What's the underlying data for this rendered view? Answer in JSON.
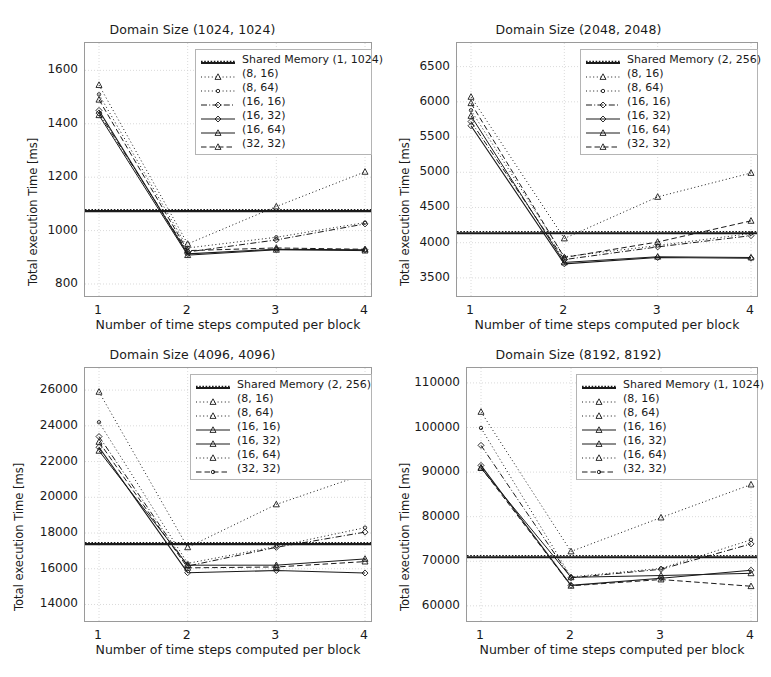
{
  "figure": {
    "width": 771,
    "height": 677,
    "background": "#ffffff",
    "line_color": "#1a1a1a",
    "grid_color": "#d0d0d0"
  },
  "common": {
    "xlabel": "Number of time steps computed per block",
    "ylabel": "Total execution Time [ms]",
    "xticks": [
      "1",
      "2",
      "3",
      "4"
    ],
    "xlim": [
      1,
      4
    ]
  },
  "chart_data": [
    {
      "type": "line",
      "title": "Domain Size (1024, 1024)",
      "xlabel": "Number of time steps computed per block",
      "ylabel": "Total execution Time [ms]",
      "x": [
        1,
        2,
        3,
        4
      ],
      "xlim": [
        1,
        4
      ],
      "ylim": [
        770,
        1680
      ],
      "yticks": [
        800,
        1000,
        1200,
        1400,
        1600
      ],
      "ytick_labels": [
        "800",
        "1000",
        "1200",
        "1400",
        "1600"
      ],
      "grid": true,
      "legend_position": "upper right",
      "hline": {
        "label": "Shared Memory (1, 1024)",
        "value": 1073
      },
      "series": [
        {
          "name": "(8, 16)",
          "values": [
            1545,
            950,
            1090,
            1220
          ]
        },
        {
          "name": "(8, 64)",
          "values": [
            1510,
            935,
            975,
            1030
          ]
        },
        {
          "name": "(16, 16)",
          "values": [
            1440,
            920,
            965,
            1025
          ]
        },
        {
          "name": "(16, 32)",
          "values": [
            1450,
            913,
            930,
            928
          ]
        },
        {
          "name": "(16, 64)",
          "values": [
            1432,
            908,
            928,
            925
          ]
        },
        {
          "name": "(32, 32)",
          "values": [
            1490,
            925,
            935,
            930
          ]
        }
      ]
    },
    {
      "type": "line",
      "title": "Domain Size (2048, 2048)",
      "xlabel": "Number of time steps computed per block",
      "ylabel": "Total execution Time [ms]",
      "x": [
        1,
        2,
        3,
        4
      ],
      "xlim": [
        1,
        4
      ],
      "ylim": [
        3300,
        6750
      ],
      "yticks": [
        3500,
        4000,
        4500,
        5000,
        5500,
        6000,
        6500
      ],
      "ytick_labels": [
        "3500",
        "4000",
        "4500",
        "5000",
        "5500",
        "6000",
        "6500"
      ],
      "grid": true,
      "legend_position": "upper right",
      "hline": {
        "label": "Shared Memory (2, 256)",
        "value": 4135
      },
      "series": [
        {
          "name": "(8, 16)",
          "values": [
            6070,
            4060,
            4650,
            4990
          ]
        },
        {
          "name": "(8, 64)",
          "values": [
            5880,
            3800,
            3960,
            4130
          ]
        },
        {
          "name": "(16, 16)",
          "values": [
            5720,
            3760,
            3940,
            4100
          ]
        },
        {
          "name": "(16, 32)",
          "values": [
            5660,
            3700,
            3790,
            3780
          ]
        },
        {
          "name": "(16, 64)",
          "values": [
            5800,
            3720,
            3800,
            3790
          ]
        },
        {
          "name": "(32, 32)",
          "values": [
            5980,
            3790,
            4010,
            4310
          ]
        }
      ]
    },
    {
      "type": "line",
      "title": "Domain Size (4096, 4096)",
      "xlabel": "Number of time steps computed per block",
      "ylabel": "Total execution Time [ms]",
      "x": [
        1,
        2,
        3,
        4
      ],
      "xlim": [
        1,
        4
      ],
      "ylim": [
        13300,
        26900
      ],
      "yticks": [
        14000,
        16000,
        18000,
        20000,
        22000,
        24000,
        26000
      ],
      "ytick_labels": [
        "14000",
        "16000",
        "18000",
        "20000",
        "22000",
        "24000",
        "26000"
      ],
      "grid": true,
      "legend_position": "upper right",
      "hline": {
        "label": "Shared Memory (2, 256)",
        "value": 17380
      },
      "series": [
        {
          "name": "(8, 16)",
          "values": [
            25900,
            17200,
            19600,
            21300
          ]
        },
        {
          "name": "(8, 64)",
          "values": [
            24200,
            16300,
            17250,
            18300
          ]
        },
        {
          "name": "(16, 16)",
          "values": [
            23400,
            16150,
            17200,
            18050
          ]
        },
        {
          "name": "(16, 32)",
          "values": [
            22800,
            15780,
            15900,
            15760
          ]
        },
        {
          "name": "(16, 64)",
          "values": [
            22600,
            16200,
            16200,
            16550
          ]
        },
        {
          "name": "(32, 32)",
          "values": [
            23100,
            16050,
            16100,
            16400
          ]
        }
      ]
    },
    {
      "type": "line",
      "title": "Domain Size (8192, 8192)",
      "xlabel": "Number of time steps computed per block",
      "ylabel": "Total execution Time [ms]",
      "x": [
        1,
        2,
        3,
        4
      ],
      "xlim": [
        1,
        4
      ],
      "ylim": [
        57500,
        112000
      ],
      "yticks": [
        60000,
        70000,
        80000,
        90000,
        100000,
        110000
      ],
      "ytick_labels": [
        "60000",
        "70000",
        "80000",
        "90000",
        "100000",
        "110000"
      ],
      "grid": true,
      "legend_position": "upper right",
      "hline": {
        "label": "Shared Memory (1, 1024)",
        "value": 70900
      },
      "series": [
        {
          "name": "(8, 16)",
          "values": [
            103500,
            72200,
            79800,
            87200
          ]
        },
        {
          "name": "(8, 64)",
          "values": [
            99900,
            66500,
            68400,
            74800
          ]
        },
        {
          "name": "(16, 16)",
          "values": [
            96000,
            66300,
            68200,
            73900
          ]
        },
        {
          "name": "(16, 32)",
          "values": [
            91500,
            64600,
            66200,
            68000
          ]
        },
        {
          "name": "(16, 64)",
          "values": [
            90900,
            66400,
            66800,
            67300
          ]
        },
        {
          "name": "(32, 32)",
          "values": [
            91000,
            64500,
            65900,
            64400
          ]
        }
      ]
    }
  ],
  "legends": [
    {
      "entries": [
        {
          "label": "Shared Memory (1, 1024)",
          "style": "solid-thick",
          "marker": "none"
        },
        {
          "label": "(8, 16)",
          "style": "dotted",
          "marker": "tri"
        },
        {
          "label": "(8, 64)",
          "style": "dotted",
          "marker": "dot"
        },
        {
          "label": "(16, 16)",
          "style": "dashdot",
          "marker": "diamond"
        },
        {
          "label": "(16, 32)",
          "style": "solid",
          "marker": "diamond"
        },
        {
          "label": "(16, 64)",
          "style": "solid",
          "marker": "tri"
        },
        {
          "label": "(32, 32)",
          "style": "dashed",
          "marker": "tri"
        }
      ]
    },
    {
      "entries": [
        {
          "label": "Shared Memory (2, 256)",
          "style": "solid-thick",
          "marker": "none"
        },
        {
          "label": "(8, 16)",
          "style": "dotted",
          "marker": "tri"
        },
        {
          "label": "(8, 64)",
          "style": "dotted",
          "marker": "dot"
        },
        {
          "label": "(16, 16)",
          "style": "dashdot",
          "marker": "diamond"
        },
        {
          "label": "(16, 32)",
          "style": "solid",
          "marker": "diamond"
        },
        {
          "label": "(16, 64)",
          "style": "solid",
          "marker": "tri"
        },
        {
          "label": "(32, 32)",
          "style": "dashed",
          "marker": "tri"
        }
      ]
    },
    {
      "entries": [
        {
          "label": "Shared Memory (2, 256)",
          "style": "solid-thick",
          "marker": "none"
        },
        {
          "label": "(8, 16)",
          "style": "dotted",
          "marker": "tri"
        },
        {
          "label": "(8, 64)",
          "style": "dotted",
          "marker": "tri"
        },
        {
          "label": "(16, 16)",
          "style": "solid",
          "marker": "tri"
        },
        {
          "label": "(16, 32)",
          "style": "solid",
          "marker": "tri"
        },
        {
          "label": "(16, 64)",
          "style": "dotted",
          "marker": "tri"
        },
        {
          "label": "(32, 32)",
          "style": "dashed",
          "marker": "dot"
        }
      ]
    },
    {
      "entries": [
        {
          "label": "Shared Memory (1, 1024)",
          "style": "solid-thick",
          "marker": "none"
        },
        {
          "label": "(8, 16)",
          "style": "dotted",
          "marker": "tri"
        },
        {
          "label": "(8, 64)",
          "style": "dotted",
          "marker": "tri"
        },
        {
          "label": "(16, 16)",
          "style": "solid",
          "marker": "tri"
        },
        {
          "label": "(16, 32)",
          "style": "solid",
          "marker": "tri"
        },
        {
          "label": "(16, 64)",
          "style": "dotted",
          "marker": "tri"
        },
        {
          "label": "(32, 32)",
          "style": "dashed",
          "marker": "dot"
        }
      ]
    }
  ]
}
